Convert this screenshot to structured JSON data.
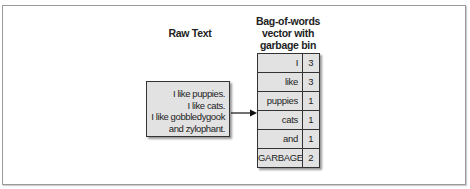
{
  "diagram": {
    "raw_text_title": "Raw Text",
    "bow_title_lines": [
      "Bag-of-words",
      "vector with",
      "garbage bin"
    ],
    "raw_text_lines": [
      "I like puppies.",
      "I like cats.",
      "I like gobbledygook",
      "and zylophant."
    ],
    "arrow": "right-arrow",
    "vector": [
      {
        "word": "I",
        "count": "3"
      },
      {
        "word": "like",
        "count": "3"
      },
      {
        "word": "puppies",
        "count": "1"
      },
      {
        "word": "cats",
        "count": "1"
      },
      {
        "word": "and",
        "count": "1"
      },
      {
        "word": "GARBAGE",
        "count": "2"
      }
    ],
    "colors": {
      "box_fill": "#e2e2e2",
      "border": "#333333",
      "frame": "#9a9a9a"
    }
  }
}
